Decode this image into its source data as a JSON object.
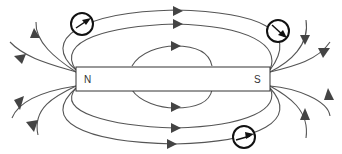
{
  "diagram": {
    "type": "bar-magnet-field-lines",
    "magnet": {
      "north_label": "N",
      "south_label": "S"
    },
    "compasses": [
      {
        "name": "compass-top-left",
        "needle_direction": "up-right"
      },
      {
        "name": "compass-top-right",
        "needle_direction": "down-right"
      },
      {
        "name": "compass-bottom",
        "needle_direction": "right"
      }
    ],
    "colors": {
      "line": "#555555",
      "arrow": "#444444",
      "magnet_fill": "#ffffff",
      "magnet_stroke": "#333333",
      "compass": "#111111"
    }
  }
}
